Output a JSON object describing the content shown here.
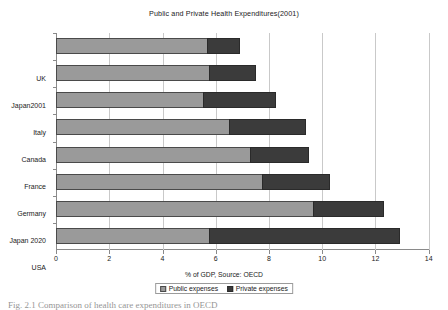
{
  "chart_data": {
    "type": "bar",
    "orientation": "horizontal",
    "stacked": true,
    "title": "Public and Private Health Expenditures(2001)",
    "xlabel": "% of GDP, Source: OECD",
    "ylabel": "",
    "xlim": [
      0,
      14
    ],
    "xticks": [
      0,
      2,
      4,
      6,
      8,
      10,
      12,
      14
    ],
    "grid": true,
    "grid_axis": "x",
    "legend_position": "bottom",
    "categories": [
      "UK",
      "Japan2001",
      "Italy",
      "Canada",
      "France",
      "Germany",
      "Japan 2020",
      "USA"
    ],
    "series": [
      {
        "name": "Public expenses",
        "color": "#9a9a9a",
        "values": [
          5.65,
          5.75,
          5.5,
          6.5,
          7.3,
          7.75,
          9.65,
          5.75
        ]
      },
      {
        "name": "Private expenses",
        "color": "#3b3b3b",
        "values": [
          1.25,
          1.75,
          2.75,
          2.9,
          2.2,
          2.55,
          2.65,
          7.15
        ]
      }
    ],
    "totals": [
      6.9,
      7.5,
      8.25,
      9.4,
      9.5,
      10.3,
      12.3,
      12.9
    ]
  },
  "legend": {
    "items": [
      {
        "label": "Public expenses",
        "swatch": "public-swatch"
      },
      {
        "label": "Private expenses",
        "swatch": "private-swatch"
      }
    ]
  },
  "caption": {
    "text": "Fig. 2.1  Comparison of health care expenditures in OECD"
  }
}
